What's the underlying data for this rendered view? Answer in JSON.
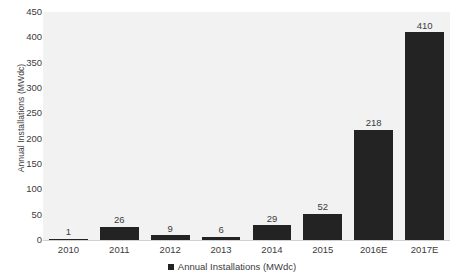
{
  "chart_data": {
    "type": "bar",
    "title": "",
    "subtitle": "",
    "xlabel": "",
    "ylabel": "Annual Installations (MWdc)",
    "categories": [
      "2010",
      "2011",
      "2012",
      "2013",
      "2014",
      "2015",
      "2016E",
      "2017E"
    ],
    "values": [
      1,
      26,
      9,
      6,
      29,
      52,
      218,
      410
    ],
    "series": [
      {
        "name": "Annual Installations (MWdc)",
        "values": [
          1,
          26,
          9,
          6,
          29,
          52,
          218,
          410
        ],
        "color": "#232323"
      }
    ],
    "ylim": [
      0,
      450
    ],
    "ytick_step": 50,
    "ytick_labels": [
      "450",
      "400",
      "350",
      "300",
      "250",
      "200",
      "150",
      "100",
      "50",
      "0"
    ],
    "ytick_values": [
      450,
      400,
      350,
      300,
      250,
      200,
      150,
      100,
      50,
      0
    ],
    "grid": false,
    "data_labels_shown": true,
    "legend": {
      "position": "bottom",
      "entries": [
        {
          "label": "Annual Installations (MWdc)",
          "color": "#232323"
        }
      ]
    },
    "colors": {
      "bar": "#232323",
      "plot_background": "#f2f2f2",
      "page_background": "#ffffff",
      "text": "#3c3c3c",
      "axis_line": "#d0d0d0"
    }
  }
}
